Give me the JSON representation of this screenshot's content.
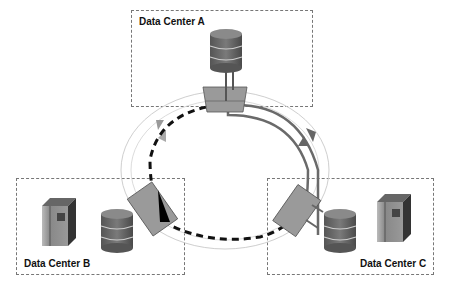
{
  "data_centers": [
    {
      "id": "A",
      "label": "Data Center A",
      "devices": [
        "database"
      ]
    },
    {
      "id": "B",
      "label": "Data Center B",
      "devices": [
        "server",
        "database"
      ]
    },
    {
      "id": "C",
      "label": "Data Center C",
      "devices": [
        "database",
        "server"
      ]
    }
  ],
  "ring": {
    "type": "optical ring",
    "nodes": 3,
    "paths": [
      {
        "style": "solid-gray",
        "direction": "clockwise A to C"
      },
      {
        "style": "dashed-black",
        "direction": "counter-clockwise A via B to C"
      }
    ]
  },
  "colors": {
    "box_border": "#777777",
    "node_fill": "#999999",
    "ring_line": "#cccccc",
    "solid_path": "#666666",
    "dashed_path": "#111111",
    "db_fill": "#6b6b6b"
  }
}
